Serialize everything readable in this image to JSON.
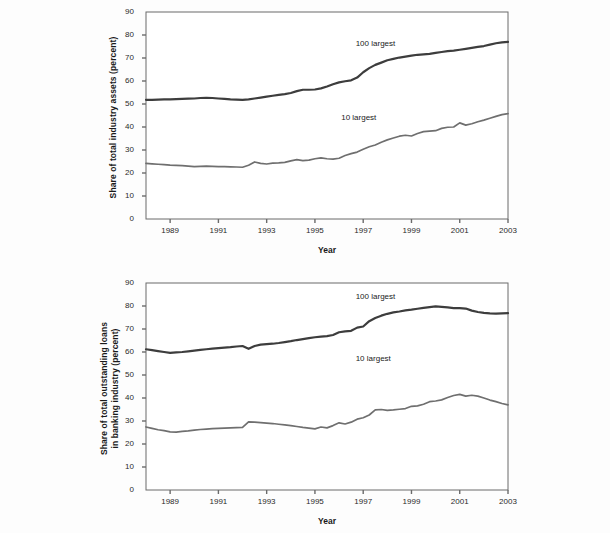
{
  "figure": {
    "background": "#fdfdfd",
    "axis_color": "#6b6b6b",
    "series_colors": {
      "100_largest": "#3d3d3d",
      "10_largest": "#6f6f6f"
    }
  },
  "chart_data": [
    {
      "type": "line",
      "title": "",
      "xlabel": "Year",
      "ylabel": "Share of total industry assets (percent)",
      "xlim": [
        1988.0,
        2003.0
      ],
      "ylim": [
        0,
        90
      ],
      "yticks": [
        0,
        10,
        20,
        30,
        40,
        50,
        60,
        70,
        80,
        90
      ],
      "xticks": [
        1989,
        1991,
        1993,
        1995,
        1997,
        1999,
        2001,
        2003
      ],
      "grid": false,
      "legend_position": "inline-annotation",
      "annotations": [
        {
          "text": "100 largest",
          "x": 1997.6,
          "y": 76
        },
        {
          "text": "10 largest",
          "x": 1997.0,
          "y": 44
        }
      ],
      "x": [
        1988.0,
        1988.25,
        1988.5,
        1988.75,
        1989.0,
        1989.25,
        1989.5,
        1989.75,
        1990.0,
        1990.25,
        1990.5,
        1990.75,
        1991.0,
        1991.25,
        1991.5,
        1991.75,
        1992.0,
        1992.25,
        1992.5,
        1992.75,
        1993.0,
        1993.25,
        1993.5,
        1993.75,
        1994.0,
        1994.25,
        1994.5,
        1994.75,
        1995.0,
        1995.25,
        1995.5,
        1995.75,
        1996.0,
        1996.25,
        1996.5,
        1996.75,
        1997.0,
        1997.25,
        1997.5,
        1997.75,
        1998.0,
        1998.25,
        1998.5,
        1998.75,
        1999.0,
        1999.25,
        1999.5,
        1999.75,
        2000.0,
        2000.25,
        2000.5,
        2000.75,
        2001.0,
        2001.25,
        2001.5,
        2001.75,
        2002.0,
        2002.25,
        2002.5,
        2002.75,
        2003.0
      ],
      "series": [
        {
          "name": "100 largest",
          "color": "#3d3d3d",
          "values": [
            51.8,
            51.8,
            51.9,
            52.0,
            52.0,
            52.1,
            52.2,
            52.3,
            52.4,
            52.6,
            52.7,
            52.6,
            52.4,
            52.2,
            52.0,
            51.9,
            51.8,
            52.0,
            52.4,
            52.8,
            53.2,
            53.6,
            54.0,
            54.3,
            54.8,
            55.6,
            56.2,
            56.2,
            56.3,
            56.8,
            57.6,
            58.6,
            59.4,
            59.9,
            60.3,
            61.5,
            63.8,
            65.6,
            67.0,
            68.0,
            69.0,
            69.6,
            70.2,
            70.6,
            71.0,
            71.4,
            71.6,
            71.8,
            72.2,
            72.6,
            73.0,
            73.2,
            73.6,
            74.0,
            74.4,
            74.8,
            75.2,
            75.8,
            76.4,
            76.8,
            77.0
          ]
        },
        {
          "name": "10 largest",
          "color": "#6f6f6f",
          "values": [
            24.2,
            24.0,
            23.8,
            23.6,
            23.4,
            23.3,
            23.2,
            23.0,
            22.8,
            22.9,
            23.0,
            22.9,
            22.8,
            22.8,
            22.7,
            22.6,
            22.5,
            23.4,
            24.8,
            24.2,
            23.9,
            24.3,
            24.4,
            24.6,
            25.3,
            25.8,
            25.4,
            25.6,
            26.2,
            26.6,
            26.2,
            26.0,
            26.4,
            27.6,
            28.4,
            29.1,
            30.3,
            31.4,
            32.2,
            33.4,
            34.4,
            35.2,
            36.0,
            36.4,
            36.1,
            37.2,
            38.0,
            38.2,
            38.4,
            39.4,
            39.9,
            40.0,
            41.8,
            40.8,
            41.4,
            42.3,
            43.0,
            43.8,
            44.6,
            45.4,
            45.8
          ]
        }
      ]
    },
    {
      "type": "line",
      "title": "",
      "xlabel": "Year",
      "ylabel": "Share of total outstanding loans in banking industry (percent)",
      "xlim": [
        1988.0,
        2003.0
      ],
      "ylim": [
        0,
        90
      ],
      "yticks": [
        0,
        10,
        20,
        30,
        40,
        50,
        60,
        70,
        80,
        90
      ],
      "xticks": [
        1989,
        1991,
        1993,
        1995,
        1997,
        1999,
        2001,
        2003
      ],
      "grid": false,
      "legend_position": "inline-annotation",
      "annotations": [
        {
          "text": "100 largest",
          "x": 1997.6,
          "y": 84
        },
        {
          "text": "10 largest",
          "x": 1997.6,
          "y": 57
        }
      ],
      "x": [
        1988.0,
        1988.25,
        1988.5,
        1988.75,
        1989.0,
        1989.25,
        1989.5,
        1989.75,
        1990.0,
        1990.25,
        1990.5,
        1990.75,
        1991.0,
        1991.25,
        1991.5,
        1991.75,
        1992.0,
        1992.25,
        1992.5,
        1992.75,
        1993.0,
        1993.25,
        1993.5,
        1993.75,
        1994.0,
        1994.25,
        1994.5,
        1994.75,
        1995.0,
        1995.25,
        1995.5,
        1995.75,
        1996.0,
        1996.25,
        1996.5,
        1996.75,
        1997.0,
        1997.25,
        1997.5,
        1997.75,
        1998.0,
        1998.25,
        1998.5,
        1998.75,
        1999.0,
        1999.25,
        1999.5,
        1999.75,
        2000.0,
        2000.25,
        2000.5,
        2000.75,
        2001.0,
        2001.25,
        2001.5,
        2001.75,
        2002.0,
        2002.25,
        2002.5,
        2002.75,
        2003.0
      ],
      "series": [
        {
          "name": "100 largest",
          "color": "#3d3d3d",
          "values": [
            61.2,
            60.8,
            60.4,
            60.0,
            59.6,
            59.8,
            60.0,
            60.3,
            60.6,
            60.9,
            61.2,
            61.5,
            61.7,
            61.9,
            62.1,
            62.4,
            62.6,
            61.4,
            62.6,
            63.2,
            63.4,
            63.6,
            63.9,
            64.3,
            64.7,
            65.2,
            65.6,
            66.0,
            66.4,
            66.7,
            66.9,
            67.4,
            68.6,
            69.0,
            69.2,
            70.6,
            71.1,
            73.4,
            74.8,
            75.8,
            76.6,
            77.2,
            77.6,
            78.1,
            78.4,
            78.8,
            79.2,
            79.5,
            79.8,
            79.6,
            79.4,
            79.1,
            79.1,
            78.9,
            78.0,
            77.4,
            77.0,
            76.8,
            76.7,
            76.8,
            76.9
          ]
        },
        {
          "name": "10 largest",
          "color": "#6f6f6f",
          "values": [
            27.4,
            26.8,
            26.2,
            25.8,
            25.3,
            25.2,
            25.5,
            25.7,
            26.0,
            26.3,
            26.5,
            26.7,
            26.8,
            26.9,
            27.0,
            27.1,
            27.2,
            29.6,
            29.5,
            29.3,
            29.1,
            28.9,
            28.6,
            28.3,
            28.0,
            27.6,
            27.2,
            26.9,
            26.6,
            27.4,
            27.0,
            28.0,
            29.2,
            28.7,
            29.5,
            30.8,
            31.4,
            32.6,
            34.8,
            35.0,
            34.6,
            34.8,
            35.1,
            35.4,
            36.4,
            36.6,
            37.3,
            38.4,
            38.7,
            39.2,
            40.2,
            41.1,
            41.6,
            40.8,
            41.2,
            40.8,
            40.0,
            39.1,
            38.4,
            37.6,
            37.0
          ]
        }
      ]
    }
  ]
}
